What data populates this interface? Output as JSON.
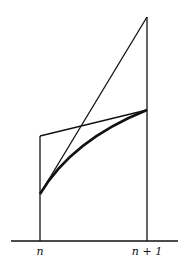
{
  "diagram": {
    "type": "geometric-figure",
    "labels": {
      "left_tick": "n",
      "right_tick": "n + 1"
    },
    "stroke_color": "#111111",
    "geometry": {
      "baseline": {
        "x1": 11,
        "y1": 241,
        "x2": 178,
        "y2": 241
      },
      "left_vertical": {
        "x": 40,
        "y_top": 136,
        "y_bottom": 241
      },
      "right_vertical": {
        "x": 147,
        "y_top": 17,
        "y_bottom": 241
      },
      "tangent_line": {
        "x1": 40,
        "y1": 194,
        "x2": 147,
        "y2": 17
      },
      "top_segment": {
        "x1": 40,
        "y1": 136,
        "x2": 147,
        "y2": 110
      },
      "curve": {
        "start": [
          40,
          194
        ],
        "control": [
          75,
          135
        ],
        "end": [
          147,
          110
        ]
      }
    }
  }
}
